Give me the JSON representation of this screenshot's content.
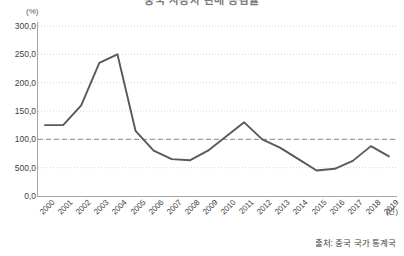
{
  "chart_data": {
    "type": "line",
    "title": "중국 자동차 판매 증감률",
    "xlabel": "(년)",
    "ylabel": "(%)",
    "x": [
      "2000",
      "2001",
      "2002",
      "2003",
      "2004",
      "2005",
      "2006",
      "2007",
      "2008",
      "2009",
      "2010",
      "2011",
      "2012",
      "2013",
      "2014",
      "2015",
      "2016",
      "2017",
      "2018",
      "2019"
    ],
    "categories": [
      "2000",
      "2001",
      "2002",
      "2003",
      "2004",
      "2005",
      "2006",
      "2007",
      "2008",
      "2009",
      "2010",
      "2011",
      "2012",
      "2013",
      "2014",
      "2015",
      "2016",
      "2017",
      "2018",
      "2019"
    ],
    "values": [
      125,
      125,
      160,
      235,
      250,
      115,
      80,
      65,
      63,
      80,
      105,
      130,
      100,
      85,
      65,
      45,
      48,
      62,
      88,
      70
    ],
    "series": [
      {
        "name": "증감률",
        "values": [
          125,
          125,
          160,
          235,
          250,
          115,
          80,
          65,
          63,
          80,
          105,
          130,
          100,
          85,
          65,
          45,
          48,
          62,
          88,
          70
        ],
        "color": "#595959"
      }
    ],
    "ylim": [
      0,
      300
    ],
    "y_ticks": [
      0,
      50,
      100,
      150,
      200,
      250,
      300
    ],
    "y_tick_labels": [
      "0,0",
      "500,0",
      "100,0",
      "150,0",
      "200,0",
      "250,0",
      "300,0"
    ],
    "grid": true,
    "grid_style": "dotted",
    "reference_line": {
      "value": 100,
      "style": "dashed",
      "color": "#8c8c8c"
    },
    "legend": "none",
    "legend_position": "none",
    "annotations": []
  },
  "axis": {
    "y_unit": "(%)",
    "x_unit": "(년)"
  },
  "footer": {
    "source": "출처: 중국 국가 통계국"
  }
}
